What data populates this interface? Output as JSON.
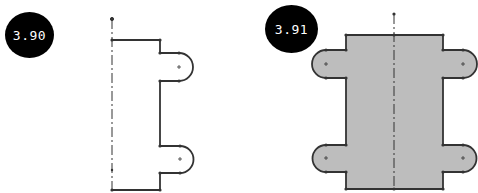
{
  "figures": [
    {
      "label": "3.90",
      "description": "Half profile sketch with centerline and two semicircular lugs",
      "filled": false
    },
    {
      "label": "3.91",
      "description": "Full mirrored profile, shaded, with four semicircular lugs about centerline",
      "filled": true
    }
  ],
  "colors": {
    "badge_bg": "#000000",
    "badge_text": "#ffffff",
    "line": "#333333",
    "fill": "#bdbdbd"
  }
}
